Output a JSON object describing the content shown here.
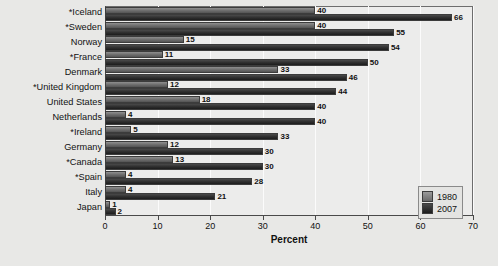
{
  "chart_data": {
    "type": "bar",
    "orientation": "horizontal",
    "title": "",
    "xlabel": "Percent",
    "ylabel": "",
    "xlim": [
      0,
      70
    ],
    "xticks": [
      0,
      10,
      20,
      30,
      40,
      50,
      60,
      70
    ],
    "grid": true,
    "legend_position": "bottom-right",
    "categories": [
      "*Iceland",
      "*Sweden",
      "Norway",
      "*France",
      "Denmark",
      "*United Kingdom",
      "United States",
      "Netherlands",
      "*Ireland",
      "Germany",
      "*Canada",
      "*Spain",
      "Italy",
      "Japan"
    ],
    "series": [
      {
        "name": "1980",
        "color": "#6f6f6f",
        "values": [
          40,
          40,
          15,
          11,
          33,
          12,
          18,
          4,
          5,
          12,
          13,
          4,
          4,
          1
        ]
      },
      {
        "name": "2007",
        "color": "#2e2e2e",
        "values": [
          66,
          55,
          54,
          50,
          46,
          44,
          40,
          40,
          33,
          30,
          30,
          28,
          21,
          2
        ]
      }
    ]
  },
  "legend": {
    "entries": [
      {
        "label": "1980"
      },
      {
        "label": "2007"
      }
    ]
  }
}
